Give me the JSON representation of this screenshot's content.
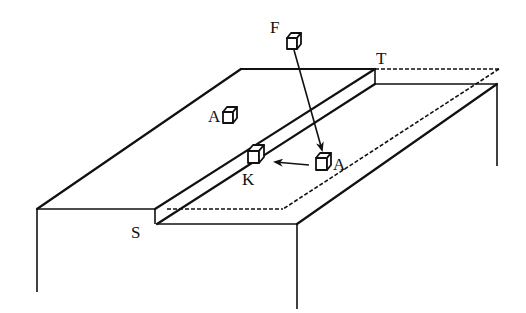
{
  "diagram": {
    "type": "isometric-table-with-slot",
    "labels": {
      "F": "F",
      "T": "T",
      "A_left": "A",
      "A_right": "A",
      "K": "K",
      "S": "S"
    },
    "objects": [
      {
        "id": "cube-F",
        "label": "F",
        "role": "falling block"
      },
      {
        "id": "cube-A-left",
        "label": "A",
        "role": "block on tabletop"
      },
      {
        "id": "cube-A-right",
        "label": "A",
        "role": "block on lower shelf"
      },
      {
        "id": "cube-K",
        "label": "K",
        "role": "block in groove"
      }
    ],
    "arrows": [
      {
        "from": "F",
        "to": "A (right)"
      },
      {
        "from": "A (right)",
        "to": "K"
      }
    ],
    "colors": {
      "ink": "#111111",
      "background": "#ffffff"
    }
  }
}
